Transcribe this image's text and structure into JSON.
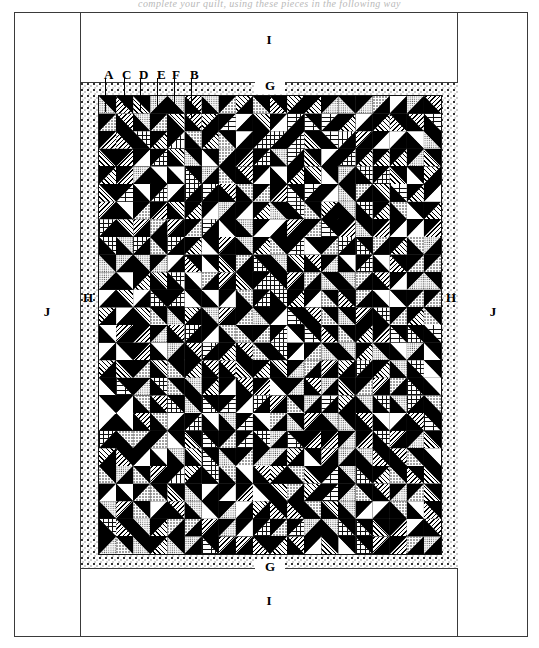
{
  "page": {
    "top_text": "complete your quilt, using these pieces in the following way"
  },
  "diagram": {
    "name": "quilt-assembly-diagram",
    "border_labels": {
      "inner_border_top": "G",
      "inner_border_bottom": "G",
      "inner_border_left": "H",
      "inner_border_right": "H",
      "outer_border_top": "I",
      "outer_border_bottom": "I",
      "outer_border_left": "J",
      "outer_border_right": "J"
    },
    "piece_callouts": [
      {
        "letter": "A",
        "x": 104,
        "y": 67,
        "leader_x": 105,
        "leader_top": 78,
        "leader_bottom": 112
      },
      {
        "letter": "C",
        "x": 122,
        "y": 67,
        "leader_x": 124,
        "leader_top": 78,
        "leader_bottom": 106
      },
      {
        "letter": "D",
        "x": 139,
        "y": 67,
        "leader_x": 140,
        "leader_top": 78,
        "leader_bottom": 110
      },
      {
        "letter": "E",
        "x": 157,
        "y": 67,
        "leader_x": 157,
        "leader_top": 78,
        "leader_bottom": 110
      },
      {
        "letter": "F",
        "x": 172,
        "y": 67,
        "leader_x": 174,
        "leader_top": 78,
        "leader_bottom": 106
      },
      {
        "letter": "B",
        "x": 190,
        "y": 67,
        "leader_x": 191,
        "leader_top": 78,
        "leader_bottom": 117
      }
    ],
    "grid": {
      "columns": 20,
      "rows": 26,
      "block_type": "half-square-triangle",
      "dark_fabric": "#000000",
      "light_prints": [
        "dot",
        "diagonal-stripe",
        "grid-check",
        "plain",
        "spring-stripe",
        "fine-dot"
      ]
    },
    "colors": {
      "dark": "#000000",
      "light": "#ffffff",
      "border_speckle": "#f2f2f2",
      "frame_line": "#3a3a3a"
    }
  }
}
